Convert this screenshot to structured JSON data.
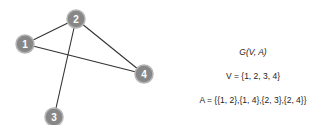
{
  "graph": {
    "node_color": "#878787",
    "node_stroke": "#b5b5b5",
    "edge_color": "#333333",
    "label_color": "#ffffff",
    "nodes": [
      {
        "id": "1",
        "label": "1",
        "x": 25,
        "y": 44
      },
      {
        "id": "2",
        "label": "2",
        "x": 76,
        "y": 19
      },
      {
        "id": "3",
        "label": "3",
        "x": 54,
        "y": 117
      },
      {
        "id": "4",
        "label": "4",
        "x": 144,
        "y": 74
      }
    ],
    "edges": [
      {
        "from": "1",
        "to": "2"
      },
      {
        "from": "1",
        "to": "4"
      },
      {
        "from": "2",
        "to": "3"
      },
      {
        "from": "2",
        "to": "4"
      }
    ]
  },
  "formulas": {
    "graph_def": "G(V, A)",
    "vertices": "V = {1, 2, 3, 4}",
    "arcs": "A = {{1, 2},{1, 4},{2, 3},{2, 4}}"
  }
}
